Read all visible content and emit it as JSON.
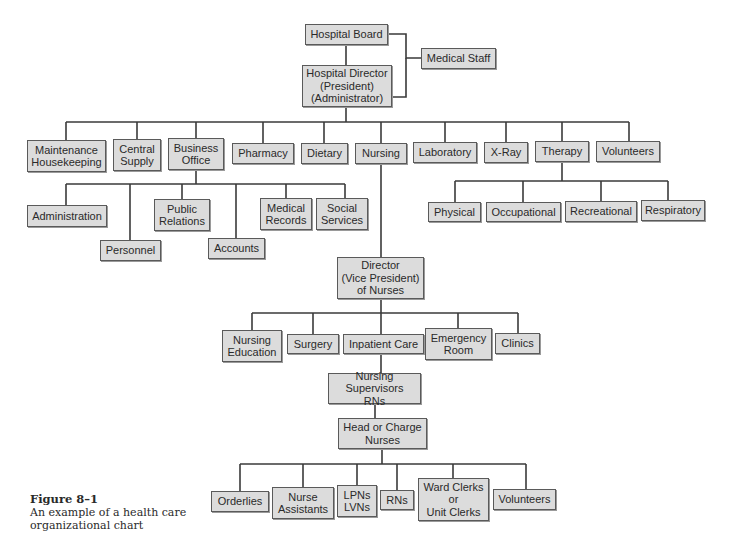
{
  "diagram": {
    "type": "organizational-chart",
    "style": {
      "box_fill": "#dcdcdc",
      "box_border": "#5a5a5a",
      "line_color": "#3a3a3a",
      "text_color": "#2a2a2a"
    },
    "nodes": [
      {
        "id": "hospital-board",
        "label": "Hospital Board",
        "x": 305,
        "y": 24,
        "w": 83,
        "h": 21
      },
      {
        "id": "medical-staff",
        "label": "Medical Staff",
        "x": 421,
        "y": 48,
        "w": 75,
        "h": 21
      },
      {
        "id": "hospital-director",
        "label": "Hospital Director\n(President)\n(Administrator)",
        "x": 302,
        "y": 65,
        "w": 90,
        "h": 42
      },
      {
        "id": "maintenance-housekeeping",
        "label": "Maintenance\nHousekeeping",
        "x": 27,
        "y": 140,
        "w": 79,
        "h": 32
      },
      {
        "id": "central-supply",
        "label": "Central\nSupply",
        "x": 113,
        "y": 139,
        "w": 48,
        "h": 32
      },
      {
        "id": "business-office",
        "label": "Business\nOffice",
        "x": 168,
        "y": 138,
        "w": 56,
        "h": 32
      },
      {
        "id": "pharmacy",
        "label": "Pharmacy",
        "x": 232,
        "y": 143,
        "w": 62,
        "h": 21
      },
      {
        "id": "dietary",
        "label": "Dietary",
        "x": 301,
        "y": 143,
        "w": 47,
        "h": 21
      },
      {
        "id": "nursing",
        "label": "Nursing",
        "x": 355,
        "y": 143,
        "w": 52,
        "h": 21
      },
      {
        "id": "laboratory",
        "label": "Laboratory",
        "x": 413,
        "y": 142,
        "w": 64,
        "h": 21
      },
      {
        "id": "x-ray",
        "label": "X-Ray",
        "x": 484,
        "y": 142,
        "w": 44,
        "h": 21
      },
      {
        "id": "therapy",
        "label": "Therapy",
        "x": 535,
        "y": 141,
        "w": 54,
        "h": 21
      },
      {
        "id": "volunteers-top",
        "label": "Volunteers",
        "x": 596,
        "y": 141,
        "w": 64,
        "h": 21
      },
      {
        "id": "administration",
        "label": "Administration",
        "x": 27,
        "y": 205,
        "w": 80,
        "h": 22
      },
      {
        "id": "personnel",
        "label": "Personnel",
        "x": 100,
        "y": 240,
        "w": 61,
        "h": 21
      },
      {
        "id": "public-relations",
        "label": "Public\nRelations",
        "x": 154,
        "y": 199,
        "w": 56,
        "h": 32
      },
      {
        "id": "accounts",
        "label": "Accounts",
        "x": 208,
        "y": 238,
        "w": 57,
        "h": 21
      },
      {
        "id": "medical-records",
        "label": "Medical\nRecords",
        "x": 260,
        "y": 198,
        "w": 52,
        "h": 32
      },
      {
        "id": "social-services",
        "label": "Social\nServices",
        "x": 316,
        "y": 198,
        "w": 52,
        "h": 32
      },
      {
        "id": "physical",
        "label": "Physical",
        "x": 428,
        "y": 202,
        "w": 53,
        "h": 20
      },
      {
        "id": "occupational",
        "label": "Occupational",
        "x": 486,
        "y": 202,
        "w": 75,
        "h": 20
      },
      {
        "id": "recreational",
        "label": "Recreational",
        "x": 565,
        "y": 201,
        "w": 72,
        "h": 21
      },
      {
        "id": "respiratory",
        "label": "Respiratory",
        "x": 641,
        "y": 200,
        "w": 64,
        "h": 21
      },
      {
        "id": "director-of-nurses",
        "label": "Director\n(Vice President)\nof Nurses",
        "x": 337,
        "y": 257,
        "w": 87,
        "h": 42
      },
      {
        "id": "nursing-education",
        "label": "Nursing\nEducation",
        "x": 222,
        "y": 330,
        "w": 60,
        "h": 32
      },
      {
        "id": "surgery",
        "label": "Surgery",
        "x": 287,
        "y": 334,
        "w": 52,
        "h": 20
      },
      {
        "id": "inpatient-care",
        "label": "Inpatient Care",
        "x": 343,
        "y": 334,
        "w": 81,
        "h": 20
      },
      {
        "id": "emergency-room",
        "label": "Emergency\nRoom",
        "x": 425,
        "y": 328,
        "w": 67,
        "h": 32
      },
      {
        "id": "clinics",
        "label": "Clinics",
        "x": 495,
        "y": 333,
        "w": 45,
        "h": 21
      },
      {
        "id": "nursing-supervisors",
        "label": "Nursing Supervisors\nRNs",
        "x": 328,
        "y": 373,
        "w": 93,
        "h": 31
      },
      {
        "id": "head-charge-nurses",
        "label": "Head or Charge\nNurses",
        "x": 338,
        "y": 418,
        "w": 89,
        "h": 31
      },
      {
        "id": "orderlies",
        "label": "Orderlies",
        "x": 211,
        "y": 491,
        "w": 58,
        "h": 21
      },
      {
        "id": "nurse-assistants",
        "label": "Nurse\nAssistants",
        "x": 272,
        "y": 487,
        "w": 62,
        "h": 32
      },
      {
        "id": "lpns-lvns",
        "label": "LPNs\nLVNs",
        "x": 337,
        "y": 485,
        "w": 40,
        "h": 32
      },
      {
        "id": "rns",
        "label": "RNs",
        "x": 380,
        "y": 490,
        "w": 34,
        "h": 20
      },
      {
        "id": "ward-clerks",
        "label": "Ward Clerks\nor\nUnit Clerks",
        "x": 418,
        "y": 478,
        "w": 71,
        "h": 43
      },
      {
        "id": "volunteers-bottom",
        "label": "Volunteers",
        "x": 493,
        "y": 489,
        "w": 63,
        "h": 21
      }
    ],
    "connectors": [
      "M346 45 V65",
      "M388 34 H406 V58 H421",
      "M392 97 H406 V58",
      "M346 107 V122",
      "M66 122 H629",
      "M66 122 V140",
      "M137 122 V139",
      "M196 122 V138",
      "M263 122 V143",
      "M324 122 V143",
      "M381 122 V143",
      "M445 122 V142",
      "M506 122 V142",
      "M562 122 V141",
      "M629 122 V141",
      "M196 170 V184",
      "M66 184 H345",
      "M66 184 V205",
      "M130 184 V240",
      "M182 184 V199",
      "M236 184 V238",
      "M286 184 V198",
      "M345 184 V198",
      "M562 162 V181",
      "M455 181 H668",
      "M455 181 V202",
      "M523 181 V202",
      "M601 181 V201",
      "M668 181 V200",
      "M381 164 V257",
      "M381 299 V313",
      "M252 313 H518",
      "M252 313 V330",
      "M313 313 V334",
      "M381 313 V373",
      "M458 313 V328",
      "M518 313 V333",
      "M375 404 V418",
      "M382 449 V464",
      "M240 464 H526",
      "M240 464 V491",
      "M303 464 V487",
      "M357 464 V485",
      "M397 464 V490",
      "M453 464 V478",
      "M526 464 V489"
    ]
  },
  "caption": {
    "figure_label": "Figure 8–1",
    "text_line1": "An example of a health care",
    "text_line2": "organizational chart"
  }
}
